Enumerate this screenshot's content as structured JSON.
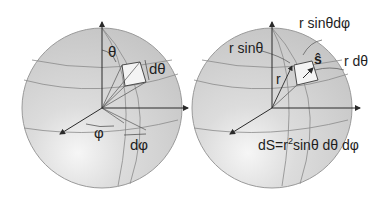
{
  "figure": {
    "left_panel": {
      "labels": {
        "theta": "θ",
        "d_theta": "dθ",
        "phi": "φ",
        "d_phi": "dφ"
      }
    },
    "right_panel": {
      "labels": {
        "r_sin_theta_d_phi": "r sinθdφ",
        "r_sin_theta": "r sinθ",
        "s_hat": "ŝ",
        "r_d_theta": "r dθ",
        "r": "r",
        "area_formula_prefix": "dS=r",
        "area_formula_exp": "2",
        "area_formula_suffix": "sinθ dθ dφ"
      }
    },
    "colors": {
      "sphere_fill": "#d2d2d2",
      "sphere_edge": "#9a9a9a",
      "grid_line": "#8a8a8a",
      "axis": "#2a2a2a",
      "patch": "#f4f4f4"
    }
  }
}
